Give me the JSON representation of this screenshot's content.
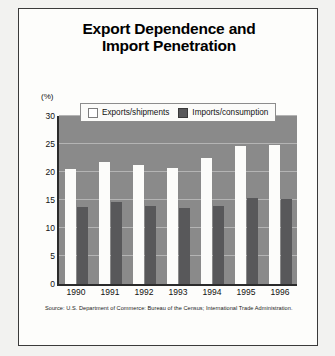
{
  "card": {
    "title_line1": "Export Dependence and",
    "title_line2": "Import Penetration",
    "source": "Source: U.S. Department of Commerce: Bureau of the Census; International Trade Administration."
  },
  "legend": {
    "exports_label": "Exports/shipments",
    "imports_label": "Imports/consumption"
  },
  "colors": {
    "plot_background": "#8a8a8a",
    "gridline": "#b4b4b4",
    "exports_bar": "#fcfcfa",
    "imports_bar": "#58585a",
    "axis": "#2b2b2b",
    "card_background": "#fdfdfb"
  },
  "chart_data": {
    "type": "bar",
    "title": "Export Dependence and Import Penetration",
    "xlabel": "",
    "ylabel": "(%)",
    "ylim": [
      0,
      30
    ],
    "yticks": [
      0,
      5,
      10,
      15,
      20,
      25,
      30
    ],
    "grid": true,
    "legend_position": "top-center",
    "categories": [
      "1990",
      "1991",
      "1992",
      "1993",
      "1994",
      "1995",
      "1996"
    ],
    "series": [
      {
        "name": "Exports/shipments",
        "color": "#fcfcfa",
        "values": [
          20.6,
          21.8,
          21.2,
          20.8,
          22.5,
          24.6,
          24.8
        ]
      },
      {
        "name": "Imports/consumption",
        "color": "#58585a",
        "values": [
          13.8,
          14.6,
          13.9,
          13.6,
          14.0,
          15.4,
          15.2
        ]
      }
    ],
    "source": "Source: U.S. Department of Commerce: Bureau of the Census; International Trade Administration."
  }
}
